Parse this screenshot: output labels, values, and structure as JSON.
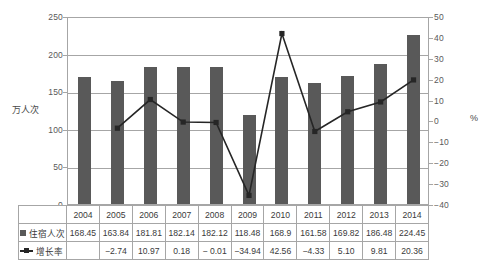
{
  "chart_data": {
    "type": "bar",
    "title": "",
    "xlabel": "",
    "ylabel": "万人次",
    "y2label": "%",
    "categories": [
      "2004",
      "2005",
      "2006",
      "2007",
      "2008",
      "2009",
      "2010",
      "2011",
      "2012",
      "2013",
      "2014"
    ],
    "ylim": [
      0,
      250
    ],
    "y2lim": [
      -40,
      50
    ],
    "yticks": [
      250,
      200,
      150,
      100,
      50,
      0
    ],
    "y2ticks": [
      50,
      40,
      30,
      20,
      10,
      0,
      -10,
      -20,
      -30,
      -40
    ],
    "grid": true,
    "legend_position": "table-row-labels",
    "series": [
      {
        "name": "住宿人次",
        "type": "bar",
        "axis": "left",
        "color": "#595959",
        "values": [
          168.45,
          163.84,
          181.81,
          182.14,
          182.12,
          118.48,
          168.9,
          161.58,
          169.82,
          186.48,
          224.45
        ],
        "labels": [
          "168.45",
          "163.84",
          "181.81",
          "182.14",
          "182.12",
          "118.48",
          "168.9",
          "161.58",
          "169.82",
          "186.48",
          "224.45"
        ]
      },
      {
        "name": "增长率",
        "type": "line",
        "axis": "right",
        "color": "#262626",
        "values": [
          null,
          -2.74,
          10.97,
          0.18,
          -0.01,
          -34.94,
          42.56,
          -4.33,
          5.1,
          9.81,
          20.36
        ],
        "labels": [
          "",
          "−2.74",
          "10.97",
          "0.18",
          "− 0.01",
          "−34.94",
          "42.56",
          "−4.33",
          "5.10",
          "9.81",
          "20.36"
        ]
      }
    ]
  },
  "table": {
    "row_labels": [
      "住宿人次",
      "增长率"
    ],
    "markers": [
      "square",
      "line-marker"
    ]
  }
}
